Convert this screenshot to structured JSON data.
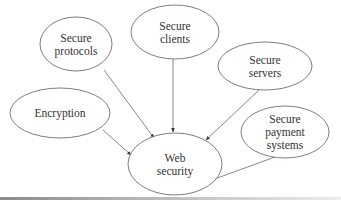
{
  "diagram": {
    "type": "concept-map",
    "colors": {
      "stroke": "#6e6e6e",
      "text": "#333333",
      "background": "#ffffff"
    },
    "nodes": [
      {
        "id": "protocols",
        "lines": [
          "Secure",
          "protocols"
        ],
        "cx": 76,
        "cy": 44,
        "rx": 36,
        "ry": 27
      },
      {
        "id": "clients",
        "lines": [
          "Secure",
          "clients"
        ],
        "cx": 175,
        "cy": 32,
        "rx": 44,
        "ry": 27
      },
      {
        "id": "servers",
        "lines": [
          "Secure",
          "servers"
        ],
        "cx": 265,
        "cy": 66,
        "rx": 47,
        "ry": 24
      },
      {
        "id": "encryption",
        "lines": [
          "Encryption"
        ],
        "cx": 60,
        "cy": 113,
        "rx": 50,
        "ry": 25
      },
      {
        "id": "payment",
        "lines": [
          "Secure",
          "payment",
          "systems"
        ],
        "cx": 285,
        "cy": 132,
        "rx": 44,
        "ry": 26
      },
      {
        "id": "web",
        "lines": [
          "Web",
          "security"
        ],
        "cx": 175,
        "cy": 164,
        "rx": 47,
        "ry": 31
      }
    ],
    "edges": [
      {
        "from": "protocols",
        "to": "web",
        "x1": 104,
        "y1": 70,
        "x2": 154,
        "y2": 138
      },
      {
        "from": "clients",
        "to": "web",
        "x1": 173,
        "y1": 59,
        "x2": 173,
        "y2": 132
      },
      {
        "from": "servers",
        "to": "web",
        "x1": 259,
        "y1": 90,
        "x2": 206,
        "y2": 140
      },
      {
        "from": "encryption",
        "to": "web",
        "x1": 103,
        "y1": 130,
        "x2": 131,
        "y2": 155
      },
      {
        "from": "payment",
        "to": "web",
        "x1": 275,
        "y1": 157,
        "x2": 209,
        "y2": 181
      }
    ]
  }
}
